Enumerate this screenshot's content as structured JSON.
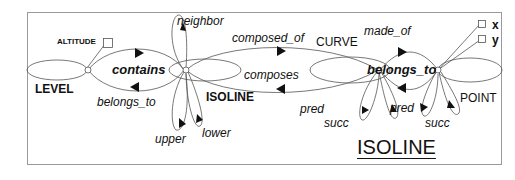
{
  "diagram": {
    "title": "ISOLINE",
    "frame_color": "#9a9a9a",
    "line_color": "#555555",
    "nodes": [
      {
        "id": "level",
        "label": "LEVEL"
      },
      {
        "id": "isoline",
        "label": "ISOLINE"
      },
      {
        "id": "curve",
        "label": "CURVE"
      },
      {
        "id": "point",
        "label": "POINT"
      }
    ],
    "attributes": {
      "level": [
        "ALTITUDE"
      ],
      "point": [
        "x",
        "y"
      ]
    },
    "relations": {
      "contains": "contains",
      "belongs_to_level": "belongs_to",
      "neighbor": "neighbor",
      "upper": "upper",
      "lower": "lower",
      "composed_of": "composed_of",
      "composes": "composes",
      "curve_pred": "pred",
      "curve_succ": "succ",
      "made_of": "made_of",
      "belongs_to_curve": "belongs_to",
      "point_pred": "pred",
      "point_succ": "succ"
    }
  }
}
